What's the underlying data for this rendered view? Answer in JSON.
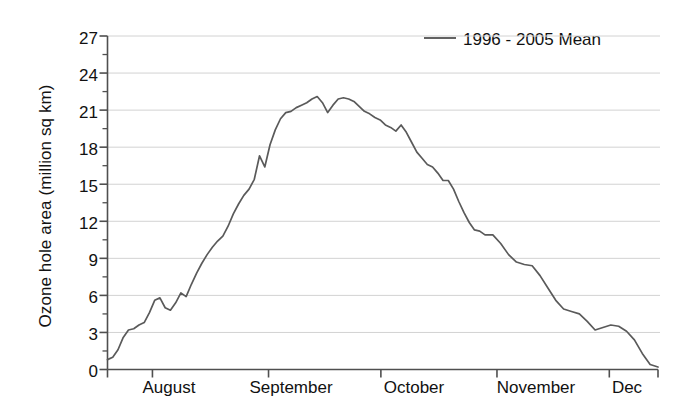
{
  "chart_data": {
    "type": "line",
    "title": "",
    "xlabel": "",
    "ylabel": "Ozone hole area (million sq km)",
    "ylim": [
      0,
      27
    ],
    "ytick_labels": [
      "0",
      "3",
      "6",
      "9",
      "12",
      "15",
      "18",
      "21",
      "24",
      "27"
    ],
    "ytick_values": [
      0,
      3,
      6,
      9,
      12,
      15,
      18,
      21,
      24,
      27
    ],
    "minor_tick_step": 1.5,
    "grid": "horizontal",
    "legend_position": "top-right",
    "legend_entries": [
      "1996 - 2005 Mean"
    ],
    "line_color": "#5a5a5a",
    "xtick_labels": [
      "August",
      "September",
      "October",
      "November",
      "Dec"
    ],
    "x_axis_note": "day-of-season from late July through early December",
    "x_month_boundaries": [
      0,
      12,
      43,
      73,
      104,
      134,
      147
    ],
    "series": [
      {
        "name": "1996 - 2005 Mean",
        "x": [
          0,
          2,
          4,
          6,
          8,
          10,
          12,
          14,
          16,
          18,
          20,
          22,
          24,
          26,
          28,
          30,
          32,
          34,
          36,
          38,
          40,
          42,
          44,
          46,
          48,
          50,
          52,
          54,
          56,
          58,
          60,
          62,
          64,
          66,
          68,
          70,
          72,
          74,
          76,
          78,
          80,
          82,
          84,
          86,
          88,
          90,
          92,
          94,
          96,
          98,
          100,
          102,
          104,
          106,
          108,
          110,
          112,
          114,
          116,
          118,
          120,
          122,
          124,
          126,
          128,
          130,
          132,
          134,
          136,
          138,
          140,
          142,
          144,
          147
        ],
        "values": [
          0.8,
          1.0,
          1.6,
          2.6,
          3.2,
          3.3,
          3.6,
          3.8,
          4.6,
          5.6,
          5.8,
          5.0,
          4.8,
          5.4,
          6.2,
          5.9,
          6.9,
          7.8,
          8.6,
          9.3,
          9.9,
          10.4,
          10.8,
          11.6,
          12.6,
          13.4,
          14.1,
          14.6,
          15.4,
          17.3,
          16.4,
          18.2,
          19.4,
          20.3,
          20.8,
          20.9,
          21.2,
          21.4,
          21.6,
          21.9,
          22.1,
          21.6,
          20.8,
          21.4,
          21.9,
          22.0,
          21.9,
          21.7,
          21.3,
          20.9,
          20.7,
          20.4,
          20.2,
          19.8,
          19.6,
          19.3,
          19.8,
          19.2,
          18.4,
          17.6,
          17.1,
          16.6,
          16.4,
          15.9,
          15.3,
          15.3,
          14.6,
          13.6,
          12.7,
          11.9,
          11.3,
          11.2,
          10.9,
          10.9
        ]
      }
    ],
    "series_tail": {
      "name": "1996 - 2005 Mean (continued)",
      "x": [
        147,
        150,
        153,
        156,
        159,
        162,
        165,
        168,
        171,
        174,
        177,
        180,
        183,
        186,
        189,
        192,
        195,
        198,
        201,
        204,
        207,
        210
      ],
      "values": [
        10.9,
        10.2,
        9.3,
        8.7,
        8.5,
        8.4,
        7.6,
        6.6,
        5.6,
        4.9,
        4.7,
        4.5,
        3.9,
        3.2,
        3.4,
        3.6,
        3.5,
        3.1,
        2.4,
        1.3,
        0.4,
        0.2
      ]
    }
  },
  "axis": {
    "y_title": "Ozone hole area (million sq km)",
    "y_labels": [
      "27",
      "24",
      "21",
      "18",
      "15",
      "12",
      "9",
      "6",
      "3",
      "0"
    ],
    "x_labels": [
      "August",
      "September",
      "October",
      "November",
      "Dec"
    ]
  },
  "legend": {
    "label": "1996 - 2005 Mean"
  }
}
